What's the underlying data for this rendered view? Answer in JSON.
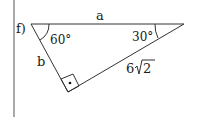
{
  "problem": {
    "label": "f)"
  },
  "triangle": {
    "side_top": "a",
    "side_left": "b",
    "hypotenuse_coef": "6",
    "hypotenuse_radicand": "2",
    "angle_left": "60°",
    "angle_right": "30°",
    "right_angle_marker": "•"
  },
  "colors": {
    "stroke": "#333333",
    "text": "#1a1a1a"
  }
}
